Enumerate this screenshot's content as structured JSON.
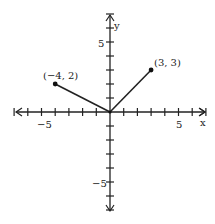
{
  "chart_data": {
    "type": "line",
    "title": "",
    "xlabel": "x",
    "ylabel": "y",
    "xlim": [
      -7,
      7
    ],
    "ylim": [
      -7,
      7
    ],
    "grid": false,
    "x_ticks": [
      -7,
      -6,
      -5,
      -4,
      -3,
      -2,
      -1,
      1,
      2,
      3,
      4,
      5,
      6,
      7
    ],
    "y_ticks": [
      -7,
      -6,
      -5,
      -4,
      -3,
      -2,
      -1,
      1,
      2,
      3,
      4,
      5,
      6,
      7
    ],
    "x_tick_labels": {
      "-5": "-5",
      "5": "5"
    },
    "y_tick_labels": {
      "5": "5",
      "-5": "-5"
    },
    "series": [
      {
        "name": "segment-left",
        "points": [
          [
            -4,
            2
          ],
          [
            0,
            0
          ]
        ]
      },
      {
        "name": "segment-right",
        "points": [
          [
            0,
            0
          ],
          [
            3,
            3
          ]
        ]
      }
    ],
    "annotations": [
      {
        "text": "(−4, 2)",
        "x": -4,
        "y": 2
      },
      {
        "text": "(3, 3)",
        "x": 3,
        "y": 3
      }
    ]
  },
  "labels": {
    "x_axis": "x",
    "y_axis": "y",
    "x_neg5": "−5",
    "x_pos5": "5",
    "y_pos5": "5",
    "y_neg5": "−5",
    "pt_left": "(−4, 2)",
    "pt_right": "(3, 3)"
  }
}
